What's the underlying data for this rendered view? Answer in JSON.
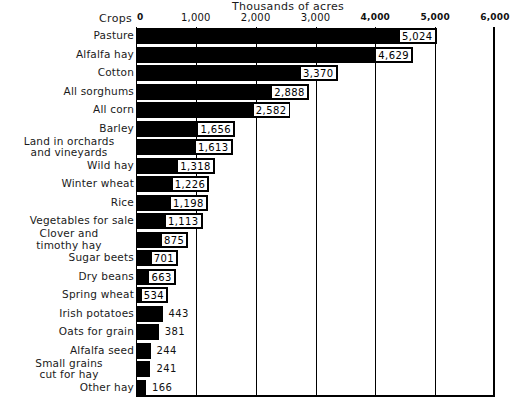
{
  "chart": {
    "type": "bar",
    "orientation": "horizontal",
    "axis_title": "Thousands of acres",
    "corner_label": "Crops",
    "xlabel": "Thousands of acres",
    "ylabel": "Crops",
    "xlim": [
      0,
      6000
    ],
    "grid": true,
    "legend": "none"
  },
  "axis": {
    "ticks": [
      {
        "label": "0",
        "value": 0,
        "bold": true
      },
      {
        "label": "1,000",
        "value": 1000,
        "bold": false
      },
      {
        "label": "2,000",
        "value": 2000,
        "bold": false
      },
      {
        "label": "3,000",
        "value": 3000,
        "bold": false
      },
      {
        "label": "4,000",
        "value": 4000,
        "bold": true
      },
      {
        "label": "5,000",
        "value": 5000,
        "bold": true
      },
      {
        "label": "6,000",
        "value": 6000,
        "bold": true
      }
    ]
  },
  "chart_data": {
    "type": "bar",
    "title": "Thousands of acres",
    "xlabel": "Thousands of acres",
    "ylabel": "Crops",
    "xlim": [
      0,
      6000
    ],
    "grid": true,
    "orientation": "horizontal",
    "categories": [
      "Pasture",
      "Alfalfa hay",
      "Cotton",
      "All sorghums",
      "All corn",
      "Barley",
      "Land in orchards and vineyards",
      "Wild hay",
      "Winter wheat",
      "Rice",
      "Vegetables for sale",
      "Clover and timothy hay",
      "Sugar beets",
      "Dry beans",
      "Spring wheat",
      "Irish potatoes",
      "Oats for grain",
      "Alfalfa seed",
      "Small grains cut for hay",
      "Other hay"
    ],
    "values": [
      5024,
      4629,
      3370,
      2888,
      2582,
      1656,
      1613,
      1318,
      1226,
      1198,
      1113,
      875,
      701,
      663,
      534,
      443,
      381,
      244,
      241,
      166
    ],
    "value_labels": [
      "5,024",
      "4,629",
      "3,370",
      "2,888",
      "2,582",
      "1,656",
      "1,613",
      "1,318",
      "1,226",
      "1,198",
      "1,113",
      "875",
      "701",
      "663",
      "534",
      "443",
      "381",
      "244",
      "241",
      "166"
    ],
    "tick_labels": [
      "0",
      "1,000",
      "2,000",
      "3,000",
      "4,000",
      "5,000",
      "6,000"
    ],
    "tick_values": [
      0,
      1000,
      2000,
      3000,
      4000,
      5000,
      6000
    ]
  },
  "rows": [
    {
      "label": "Pasture",
      "label_lines": [
        "Pasture"
      ],
      "value": 5024,
      "value_label": "5,024",
      "label_inside": true
    },
    {
      "label": "Alfalfa hay",
      "label_lines": [
        "Alfalfa hay"
      ],
      "value": 4629,
      "value_label": "4,629",
      "label_inside": true
    },
    {
      "label": "Cotton",
      "label_lines": [
        "Cotton"
      ],
      "value": 3370,
      "value_label": "3,370",
      "label_inside": true
    },
    {
      "label": "All sorghums",
      "label_lines": [
        "All sorghums"
      ],
      "value": 2888,
      "value_label": "2,888",
      "label_inside": true
    },
    {
      "label": "All corn",
      "label_lines": [
        "All corn"
      ],
      "value": 2582,
      "value_label": "2,582",
      "label_inside": true
    },
    {
      "label": "Barley",
      "label_lines": [
        "Barley"
      ],
      "value": 1656,
      "value_label": "1,656",
      "label_inside": true
    },
    {
      "label": "Land in orchards and vineyards",
      "label_lines": [
        "Land in orchards",
        "and vineyards"
      ],
      "value": 1613,
      "value_label": "1,613",
      "label_inside": true
    },
    {
      "label": "Wild hay",
      "label_lines": [
        "Wild hay"
      ],
      "value": 1318,
      "value_label": "1,318",
      "label_inside": true
    },
    {
      "label": "Winter wheat",
      "label_lines": [
        "Winter wheat"
      ],
      "value": 1226,
      "value_label": "1,226",
      "label_inside": true
    },
    {
      "label": "Rice",
      "label_lines": [
        "Rice"
      ],
      "value": 1198,
      "value_label": "1,198",
      "label_inside": true
    },
    {
      "label": "Vegetables for sale",
      "label_lines": [
        "Vegetables for sale"
      ],
      "value": 1113,
      "value_label": "1,113",
      "label_inside": true
    },
    {
      "label": "Clover and timothy hay",
      "label_lines": [
        "Clover and",
        "timothy hay"
      ],
      "value": 875,
      "value_label": "875",
      "label_inside": true
    },
    {
      "label": "Sugar beets",
      "label_lines": [
        "Sugar beets"
      ],
      "value": 701,
      "value_label": "701",
      "label_inside": true
    },
    {
      "label": "Dry beans",
      "label_lines": [
        "Dry beans"
      ],
      "value": 663,
      "value_label": "663",
      "label_inside": true
    },
    {
      "label": "Spring wheat",
      "label_lines": [
        "Spring wheat"
      ],
      "value": 534,
      "value_label": "534",
      "label_inside": true
    },
    {
      "label": "Irish potatoes",
      "label_lines": [
        "Irish potatoes"
      ],
      "value": 443,
      "value_label": "443",
      "label_inside": false
    },
    {
      "label": "Oats for grain",
      "label_lines": [
        "Oats for grain"
      ],
      "value": 381,
      "value_label": "381",
      "label_inside": false
    },
    {
      "label": "Alfalfa seed",
      "label_lines": [
        "Alfalfa seed"
      ],
      "value": 244,
      "value_label": "244",
      "label_inside": false
    },
    {
      "label": "Small grains cut for hay",
      "label_lines": [
        "Small grains",
        "cut for hay"
      ],
      "value": 241,
      "value_label": "241",
      "label_inside": false
    },
    {
      "label": "Other hay",
      "label_lines": [
        "Other hay"
      ],
      "value": 166,
      "value_label": "166",
      "label_inside": false
    }
  ],
  "colors": {
    "bar": "#000000",
    "background": "#ffffff",
    "text": "#111111",
    "gridline": "#000000"
  }
}
